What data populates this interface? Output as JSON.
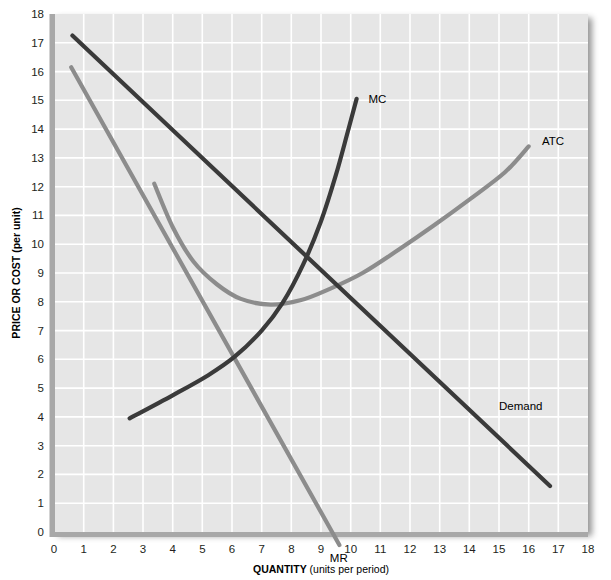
{
  "figure": {
    "width": 611,
    "height": 580,
    "background": "#ffffff",
    "plot_background": "#e6e6e6",
    "gridline_color": "#ffffff",
    "axis_color": "#a8a8a8"
  },
  "chart_data": {
    "type": "line",
    "title": "",
    "xlabel_bold": "QUANTITY",
    "xlabel_rest": " (units per period)",
    "ylabel": "PRICE OR COST (per unit)",
    "xlim": [
      0,
      18
    ],
    "ylim": [
      0,
      18
    ],
    "xticks": [
      "0",
      "1",
      "2",
      "3",
      "4",
      "5",
      "6",
      "7",
      "8",
      "9",
      "10",
      "11",
      "12",
      "13",
      "14",
      "15",
      "16",
      "17",
      "18"
    ],
    "yticks": [
      "0",
      "1",
      "2",
      "3",
      "4",
      "5",
      "6",
      "7",
      "8",
      "9",
      "10",
      "11",
      "12",
      "13",
      "14",
      "15",
      "16",
      "17",
      "18"
    ],
    "grid": true,
    "legend": "inline-labels",
    "series": [
      {
        "name": "Demand",
        "label": "Demand",
        "color": "#3a3a3a",
        "label_x": 15.0,
        "label_y": 4.35,
        "points": [
          [
            0.62,
            17.25
          ],
          [
            16.72,
            1.6
          ]
        ]
      },
      {
        "name": "MR",
        "label": "MR",
        "color": "#8c8c8c",
        "label_x": 9.6,
        "label_y": -0.95,
        "points": [
          [
            0.58,
            16.15
          ],
          [
            9.62,
            -0.45
          ]
        ]
      },
      {
        "name": "MC",
        "label": "MC",
        "color": "#3a3a3a",
        "label_x": 10.6,
        "label_y": 15.0,
        "points": [
          [
            2.55,
            3.95
          ],
          [
            4.0,
            4.75
          ],
          [
            5.2,
            5.45
          ],
          [
            6.1,
            6.1
          ],
          [
            7.0,
            7.0
          ],
          [
            7.7,
            7.95
          ],
          [
            8.4,
            9.3
          ],
          [
            9.0,
            10.8
          ],
          [
            9.5,
            12.4
          ],
          [
            9.9,
            13.9
          ],
          [
            10.2,
            15.05
          ]
        ]
      },
      {
        "name": "ATC",
        "label": "ATC",
        "color": "#8c8c8c",
        "label_x": 16.45,
        "label_y": 13.55,
        "points": [
          [
            3.38,
            12.1
          ],
          [
            4.0,
            10.6
          ],
          [
            4.7,
            9.4
          ],
          [
            5.5,
            8.6
          ],
          [
            6.3,
            8.1
          ],
          [
            7.3,
            7.9
          ],
          [
            8.3,
            8.05
          ],
          [
            9.3,
            8.45
          ],
          [
            10.4,
            9.0
          ],
          [
            11.6,
            9.8
          ],
          [
            12.8,
            10.65
          ],
          [
            14.0,
            11.55
          ],
          [
            15.2,
            12.5
          ],
          [
            16.0,
            13.4
          ]
        ]
      }
    ],
    "intersections": [
      {
        "name": "MC-MR",
        "x": 6.0,
        "y": 6.0
      },
      {
        "name": "MC-ATC-min",
        "x": 8.0,
        "y": 8.0
      },
      {
        "name": "Demand-MC",
        "x": 9.3,
        "y": 9.3
      },
      {
        "name": "Demand-ATC",
        "x": 10.3,
        "y": 8.4
      }
    ]
  }
}
